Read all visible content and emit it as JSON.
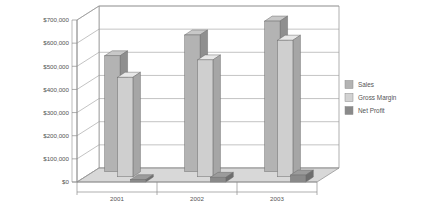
{
  "chart_data": {
    "type": "bar",
    "title": "",
    "subtitle": "",
    "xlabel": "",
    "ylabel": "",
    "categories": [
      "2001",
      "2002",
      "2003"
    ],
    "series": [
      {
        "name": "Sales",
        "values": [
          500000,
          590000,
          650000
        ],
        "color": "#b3b3b3"
      },
      {
        "name": "Gross Margin",
        "values": [
          430000,
          505000,
          590000
        ],
        "color": "#cfcfcf"
      },
      {
        "name": "Net Profit",
        "values": [
          10000,
          20000,
          30000
        ],
        "color": "#8a8a8a"
      }
    ],
    "ylim": [
      0,
      700000
    ],
    "ytick_values": [
      0,
      100000,
      200000,
      300000,
      400000,
      500000,
      600000,
      700000
    ],
    "ytick_labels": [
      "$0",
      "$100,000",
      "$200,000",
      "$300,000",
      "$400,000",
      "$500,000",
      "$600,000",
      "$700,000"
    ],
    "grid": true,
    "three_d": true,
    "legend_position": "right",
    "legend": [
      {
        "label": "Sales",
        "swatch": "#b3b3b3"
      },
      {
        "label": "Gross Margin",
        "swatch": "#d2d2d2"
      },
      {
        "label": "Net Profit",
        "swatch": "#8a8a8a"
      }
    ],
    "colors": {
      "background": "#ffffff",
      "axis": "#8d8d8d",
      "grid": "#9a9a9a",
      "floor": "#c8c8c8",
      "text": "#555555"
    }
  }
}
